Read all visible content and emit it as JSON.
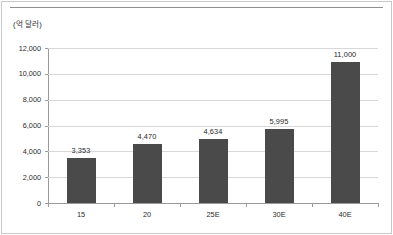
{
  "figure": {
    "unit_label": "(억 달러)",
    "bar_color": "#4a4a4a",
    "grid_color": "#d8d8d8",
    "axis_color": "#9a9a9a",
    "text_color": "#2b2b2b"
  },
  "chart_data": {
    "type": "bar",
    "title": "",
    "subtitle": "",
    "xlabel": "",
    "ylabel": "(억 달러)",
    "ylim": [
      0,
      12000
    ],
    "yticks": [
      0,
      2000,
      4000,
      6000,
      8000,
      10000,
      12000
    ],
    "ytick_labels": [
      "0",
      "2,000",
      "4,000",
      "6,000",
      "8,000",
      "10,000",
      "12,000"
    ],
    "grid": true,
    "grid_axis": "y",
    "legend": false,
    "legend_position": "none",
    "categories": [
      "15",
      "20",
      "25E",
      "30E",
      "40E"
    ],
    "values": [
      3353,
      4470,
      4634,
      5995,
      11000
    ],
    "data_labels": [
      "3,353",
      "4,470",
      "4,634",
      "5,995",
      "11,000"
    ],
    "rendered_values": [
      3500,
      4600,
      4950,
      5700,
      10900
    ],
    "series": [
      {
        "name": "",
        "values": [
          3353,
          4470,
          4634,
          5995,
          11000
        ]
      }
    ]
  }
}
